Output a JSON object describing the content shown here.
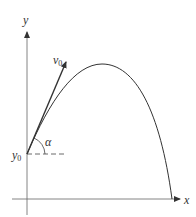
{
  "diagram": {
    "labels": {
      "y_axis": "y",
      "x_axis": "x",
      "velocity": "v",
      "velocity_sub": "0",
      "initial_height": "y",
      "initial_height_sub": "0",
      "angle": "α"
    },
    "colors": {
      "line": "#3a3a3a",
      "axis": "#555555",
      "background": "#ffffff"
    }
  }
}
